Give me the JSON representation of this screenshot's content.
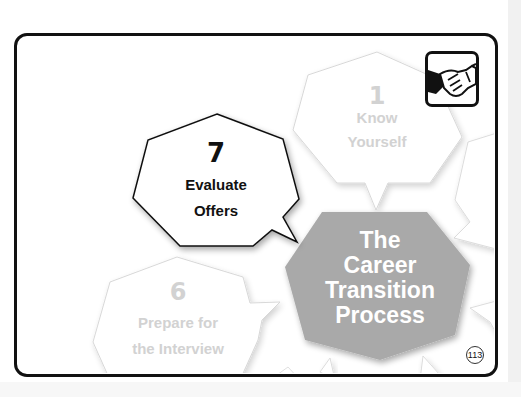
{
  "page": {
    "page_number": "113",
    "colors": {
      "frame": "#111111",
      "center_fill": "#a9a9a9",
      "faded_text": "#d2d2d2",
      "active_text": "#111111"
    }
  },
  "icon": {
    "name": "handshake-icon"
  },
  "center": {
    "lines": [
      "The",
      "Career",
      "Transition",
      "Process"
    ]
  },
  "steps": [
    {
      "number": "1",
      "lines": [
        "Know",
        "Yourself"
      ],
      "state": "faded"
    },
    {
      "number": "6",
      "lines": [
        "Prepare for",
        "the Interview"
      ],
      "state": "faded"
    },
    {
      "number": "7",
      "lines": [
        "Evaluate",
        "Offers"
      ],
      "state": "active"
    }
  ]
}
